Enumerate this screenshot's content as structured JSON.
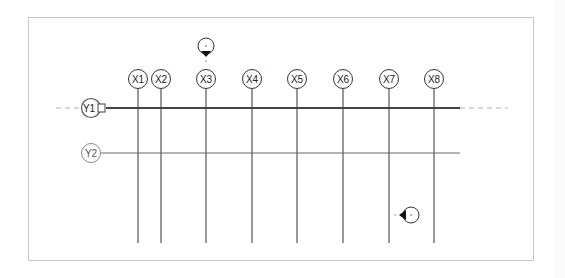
{
  "view": {
    "type": "revit-plan-view-grids",
    "frame_color": "#c8c8c8",
    "line_color": "#333333",
    "dashed_color": "#b0b0b0"
  },
  "grids_x": [
    {
      "label": "X1",
      "x": 138
    },
    {
      "label": "X2",
      "x": 161
    },
    {
      "label": "X3",
      "x": 206
    },
    {
      "label": "X4",
      "x": 252
    },
    {
      "label": "X5",
      "x": 297
    },
    {
      "label": "X6",
      "x": 343
    },
    {
      "label": "X7",
      "x": 389
    },
    {
      "label": "X8",
      "x": 434
    }
  ],
  "grids_y": [
    {
      "label": "Y1",
      "y": 108,
      "selected": true
    },
    {
      "label": "Y2",
      "y": 153,
      "selected": false
    }
  ],
  "elevation_markers": [
    {
      "name": "elevation-marker-north",
      "label": "·",
      "x": 206,
      "y": 46,
      "direction": "down"
    },
    {
      "name": "elevation-marker-east",
      "label": "·",
      "x": 411,
      "y": 215,
      "direction": "left"
    }
  ]
}
